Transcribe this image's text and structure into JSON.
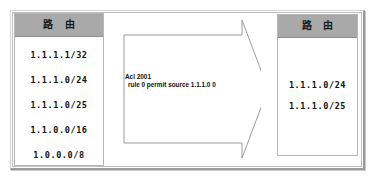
{
  "diagram": {
    "left_panel": {
      "header_label": "路 由",
      "routes": [
        "1.1.1.1/32",
        "1.1.1.0/24",
        "1.1.1.0/25",
        "1.1.0.0/16",
        "1.0.0.0/8"
      ]
    },
    "arrow": {
      "direction": "right",
      "acl_name": "Acl 2001",
      "acl_rule": "rule 0 permit source 1.1.1.0 0"
    },
    "right_panel": {
      "header_label": "路 由",
      "routes": [
        "1.1.1.0/24",
        "1.1.1.0/25"
      ]
    },
    "colors": {
      "header_gray": "#a9a9a9",
      "frame_border": "#bfbfbf",
      "text": "#111111",
      "background": "#ffffff"
    }
  }
}
